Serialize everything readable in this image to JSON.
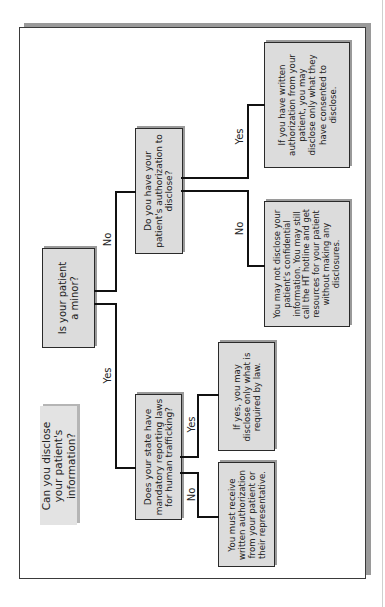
{
  "diagram": {
    "title": "Can you disclose your patient's information?",
    "nodes": {
      "minor": "Is your patient a minor?",
      "authorization": "Do you have your patient's authorization to disclose?",
      "state_laws": "Does your state have mandatory reporting laws for human trafficking?",
      "written_auth_yes": "If you have written authorization from your patient, you may disclose only what they have consented to disclose.",
      "no_auth": "You may not disclose your patient's confidential information. You may still call the HT hotline and get resources for your patient without making any disclosures.",
      "state_yes": "If yes, you may disclose only what is required by law.",
      "state_no": "You must receive written authorization from your patient or their representative."
    },
    "edges": {
      "minor_no": "No",
      "minor_yes": "Yes",
      "auth_yes": "Yes",
      "auth_no": "No",
      "state_yes": "Yes",
      "state_no": "No"
    }
  }
}
